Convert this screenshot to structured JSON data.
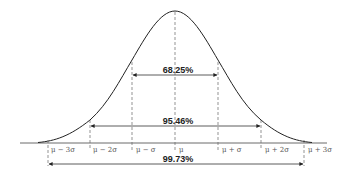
{
  "diagram": {
    "title": "",
    "type": "normal-distribution",
    "colors": {
      "curve": "#222222",
      "axis": "#333333",
      "dashed": "#555555",
      "arrow": "#333333",
      "text": "#222222"
    },
    "ticks": [
      {
        "label": "μ − 3σ"
      },
      {
        "label": "μ − 2σ"
      },
      {
        "label": "μ − σ"
      },
      {
        "label": "μ"
      },
      {
        "label": "μ + σ"
      },
      {
        "label": "μ + 2σ"
      },
      {
        "label": "μ + 3σ"
      }
    ],
    "ranges": [
      {
        "label": "68.25%",
        "from": "μ − σ",
        "to": "μ + σ"
      },
      {
        "label": "95.46%",
        "from": "μ − 2σ",
        "to": "μ + 2σ"
      },
      {
        "label": "99.73%",
        "from": "μ − 3σ",
        "to": "μ + 3σ"
      }
    ]
  }
}
